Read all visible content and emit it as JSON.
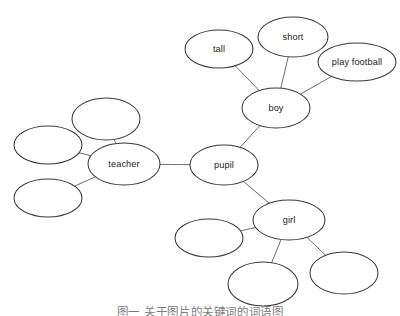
{
  "diagram": {
    "type": "word-web",
    "title_caption": "图一 关于图片的关键词的词语图",
    "background_color": "#ffffff",
    "node_stroke_color": "#3a3a3e",
    "edge_stroke_color": "#5f5f63",
    "label_color": "#1d1d20",
    "nodes": [
      {
        "id": "pupil",
        "label": "pupil",
        "cx": 224,
        "cy": 165,
        "rx": 34,
        "ry": 20
      },
      {
        "id": "teacher",
        "label": "teacher",
        "cx": 124,
        "cy": 164,
        "rx": 36,
        "ry": 21
      },
      {
        "id": "boy",
        "label": "boy",
        "cx": 276,
        "cy": 108,
        "rx": 34,
        "ry": 20
      },
      {
        "id": "girl",
        "label": "girl",
        "cx": 289,
        "cy": 220,
        "rx": 36,
        "ry": 20
      },
      {
        "id": "tall",
        "label": "tall",
        "cx": 219,
        "cy": 49,
        "rx": 34,
        "ry": 19
      },
      {
        "id": "short",
        "label": "short",
        "cx": 293,
        "cy": 37,
        "rx": 35,
        "ry": 20
      },
      {
        "id": "play_football",
        "label": "play football",
        "cx": 357,
        "cy": 62,
        "rx": 39,
        "ry": 19
      },
      {
        "id": "teacher_blank_top",
        "label": "",
        "cx": 106,
        "cy": 119,
        "rx": 34,
        "ry": 21
      },
      {
        "id": "teacher_blank_left",
        "label": "",
        "cx": 48,
        "cy": 145,
        "rx": 34,
        "ry": 19
      },
      {
        "id": "teacher_blank_bottom",
        "label": "",
        "cx": 48,
        "cy": 198,
        "rx": 34,
        "ry": 19
      },
      {
        "id": "girl_blank_left",
        "label": "",
        "cx": 209,
        "cy": 238,
        "rx": 34,
        "ry": 19
      },
      {
        "id": "girl_blank_bottom",
        "label": "",
        "cx": 263,
        "cy": 284,
        "rx": 35,
        "ry": 22
      },
      {
        "id": "girl_blank_right",
        "label": "",
        "cx": 344,
        "cy": 273,
        "rx": 34,
        "ry": 21
      }
    ],
    "edges": [
      {
        "from": "teacher",
        "to": "pupil"
      },
      {
        "from": "pupil",
        "to": "boy"
      },
      {
        "from": "pupil",
        "to": "girl"
      },
      {
        "from": "boy",
        "to": "tall"
      },
      {
        "from": "boy",
        "to": "short"
      },
      {
        "from": "boy",
        "to": "play_football"
      },
      {
        "from": "teacher",
        "to": "teacher_blank_top"
      },
      {
        "from": "teacher",
        "to": "teacher_blank_left"
      },
      {
        "from": "teacher",
        "to": "teacher_blank_bottom"
      },
      {
        "from": "girl",
        "to": "girl_blank_left"
      },
      {
        "from": "girl",
        "to": "girl_blank_bottom"
      },
      {
        "from": "girl",
        "to": "girl_blank_right"
      }
    ]
  }
}
